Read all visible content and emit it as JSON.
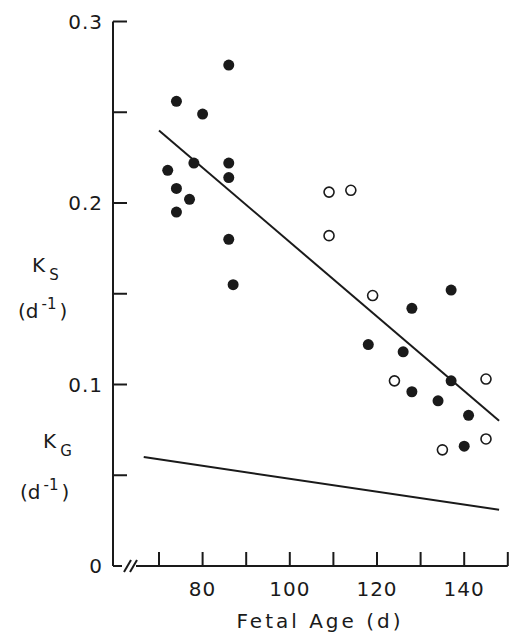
{
  "chart_data": {
    "type": "scatter",
    "title": "",
    "xlabel": "Fetal Age (d)",
    "ylabel_series": [
      {
        "symbol": "K",
        "subscript": "S",
        "units_base": "(d",
        "units_exp": "-1",
        "units_close": ")"
      },
      {
        "symbol": "K",
        "subscript": "G",
        "units_base": "(d",
        "units_exp": "-1",
        "units_close": ")"
      }
    ],
    "xlim": [
      60,
      150
    ],
    "ylim": [
      0,
      0.3
    ],
    "x_break": true,
    "x_ticks": [
      70,
      80,
      90,
      100,
      110,
      120,
      130,
      140,
      150
    ],
    "x_tick_labels": [
      "80",
      "100",
      "120",
      "140"
    ],
    "x_tick_label_values": [
      80,
      100,
      120,
      140
    ],
    "y_ticks": [
      0,
      0.05,
      0.1,
      0.15,
      0.2,
      0.25,
      0.3
    ],
    "y_tick_labels": [
      "0",
      "0.1",
      "0.2",
      "0.3"
    ],
    "y_tick_label_values": [
      0,
      0.1,
      0.2,
      0.3
    ],
    "grid": false,
    "legend": null,
    "series": [
      {
        "name": "Ks filled circles",
        "marker": "filled-circle",
        "points": [
          [
            72,
            0.218
          ],
          [
            74,
            0.256
          ],
          [
            74,
            0.208
          ],
          [
            74,
            0.195
          ],
          [
            77,
            0.202
          ],
          [
            78,
            0.222
          ],
          [
            80,
            0.249
          ],
          [
            86,
            0.276
          ],
          [
            86,
            0.222
          ],
          [
            86,
            0.214
          ],
          [
            86,
            0.18
          ],
          [
            87,
            0.155
          ],
          [
            118,
            0.122
          ],
          [
            126,
            0.118
          ],
          [
            128,
            0.142
          ],
          [
            128,
            0.096
          ],
          [
            134,
            0.091
          ],
          [
            137,
            0.152
          ],
          [
            137,
            0.102
          ],
          [
            140,
            0.066
          ],
          [
            141,
            0.083
          ]
        ]
      },
      {
        "name": "Ks open circles",
        "marker": "open-circle",
        "points": [
          [
            109,
            0.206
          ],
          [
            114,
            0.207
          ],
          [
            109,
            0.182
          ],
          [
            119,
            0.149
          ],
          [
            124,
            0.102
          ],
          [
            135,
            0.064
          ],
          [
            145,
            0.103
          ],
          [
            145,
            0.07
          ]
        ]
      },
      {
        "name": "Ks regression line",
        "marker": "line",
        "points": [
          [
            70,
            0.24
          ],
          [
            148,
            0.08
          ]
        ]
      },
      {
        "name": "KG line",
        "marker": "line",
        "points": [
          [
            66.5,
            0.06
          ],
          [
            148,
            0.031
          ]
        ]
      }
    ]
  }
}
